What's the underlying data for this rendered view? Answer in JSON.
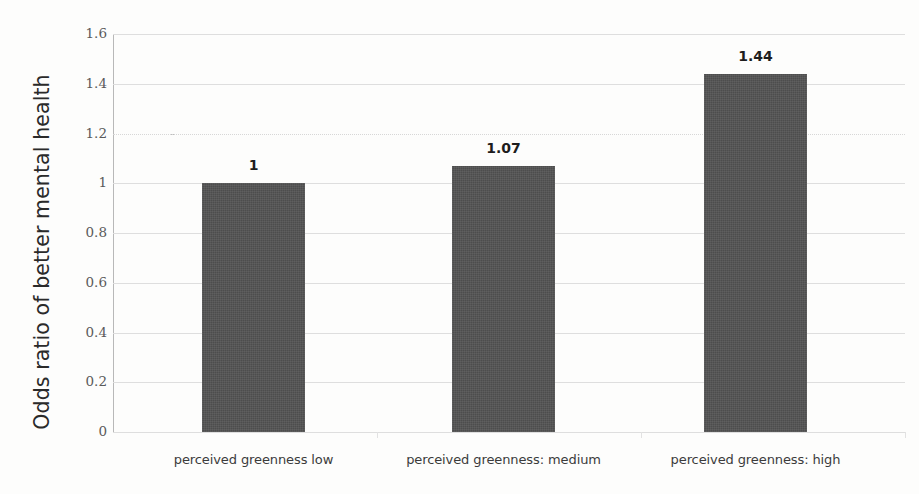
{
  "chart_data": {
    "type": "bar",
    "title": "",
    "xlabel": "",
    "ylabel": "Odds ratio of better mental health",
    "categories": [
      "perceived greenness low",
      "perceived greenness:  medium",
      "perceived greenness: high"
    ],
    "values": [
      1,
      1.07,
      1.44
    ],
    "value_labels": [
      "1",
      "1.07",
      "1.44"
    ],
    "ylim": [
      0,
      1.6
    ],
    "ytick_labels": [
      "0",
      "0.2",
      "0.4",
      "0.6",
      "0.8",
      "1",
      "1.2",
      "1.4",
      "1.6"
    ],
    "ytick_values": [
      0,
      0.2,
      0.4,
      0.6,
      0.8,
      1,
      1.2,
      1.4,
      1.6
    ],
    "grid": true,
    "legend": false,
    "bar_color": "#4d4d4d",
    "gridline_color": "#dedede",
    "axis_color": "#b8b8b8",
    "text_color": "#2a2a2a"
  }
}
